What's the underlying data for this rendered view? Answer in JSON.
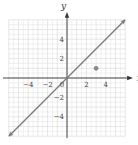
{
  "chart_data": {
    "type": "line",
    "title": "",
    "xlabel": "x",
    "ylabel": "y",
    "xlim": [
      -6,
      6
    ],
    "ylim": [
      -6,
      6
    ],
    "grid": true,
    "x_ticks": [
      -4,
      -2,
      0,
      2,
      4
    ],
    "x_tick_labels": [
      "-4",
      "-2",
      "0",
      "2",
      "4"
    ],
    "y_ticks": [
      4,
      2,
      -2,
      -4
    ],
    "y_tick_labels": [
      "4",
      "2",
      "-2",
      "-4"
    ],
    "series": [
      {
        "name": "line y = x",
        "type": "line",
        "x": [
          -6,
          6
        ],
        "y": [
          -6,
          6
        ],
        "arrows": "both"
      },
      {
        "name": "point",
        "type": "scatter",
        "x": [
          3
        ],
        "y": [
          1
        ]
      }
    ],
    "colors": {
      "line": "#7a7a7a",
      "point": "#8a8a8a",
      "grid": "#dcdcdc",
      "axis": "#333333"
    }
  }
}
